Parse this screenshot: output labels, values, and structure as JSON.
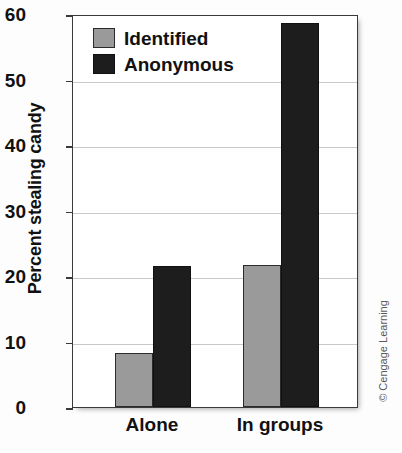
{
  "chart_data": {
    "type": "bar",
    "title": "",
    "xlabel": "",
    "ylabel": "Percent stealing candy",
    "categories": [
      "Alone",
      "In groups"
    ],
    "series": [
      {
        "name": "Identified",
        "values": [
          8.3,
          21.7
        ],
        "color": "#9a9a9a"
      },
      {
        "name": "Anonymous",
        "values": [
          21.6,
          58.7
        ],
        "color": "#1d1d1d"
      }
    ],
    "ylim": [
      0,
      60
    ],
    "ytick_values": [
      0,
      10,
      20,
      30,
      40,
      50,
      60
    ],
    "ytick_labels": [
      "0",
      "10",
      "20",
      "30",
      "40",
      "50",
      "60"
    ],
    "grid": "horizontal",
    "legend_position": "top-left"
  },
  "legend": {
    "items": [
      {
        "label": "Identified",
        "swatch": "identified"
      },
      {
        "label": "Anonymous",
        "swatch": "anonymous"
      }
    ]
  },
  "credit": {
    "text": "© Cengage Learning"
  }
}
